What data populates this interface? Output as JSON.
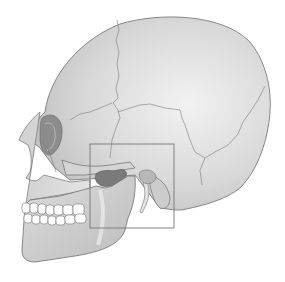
{
  "figure": {
    "highlight": "Temporomandibular joint region",
    "colors": {
      "background": "#ffffff",
      "bone_light": "#e6e6e6",
      "bone_mid": "#cfcfcf",
      "bone_dark": "#9a9a9a",
      "outline": "#6e6e6e",
      "suture": "#7a7a7a",
      "teeth": "#ffffff",
      "highlight_box": "#777777"
    },
    "highlight_box": {
      "x": 90,
      "y": 144,
      "width": 84,
      "height": 84
    }
  }
}
